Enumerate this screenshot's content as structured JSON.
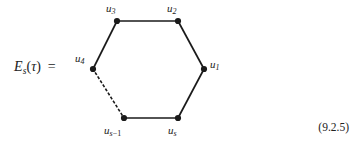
{
  "figure": {
    "kind": "graph-diagram",
    "background_color": "#ffffff",
    "ink_color": "#1a1a1a",
    "lhs": {
      "symbol": "E",
      "symbol_subscript": "s",
      "open_paren": "(",
      "argument": "τ",
      "close_paren": ")",
      "equals": "="
    },
    "vertices": [
      {
        "id": "u1",
        "base": "u",
        "sub": "1",
        "sub_op": "",
        "x": 204,
        "y": 69,
        "label_pos": "right"
      },
      {
        "id": "u2",
        "base": "u",
        "sub": "2",
        "sub_op": "",
        "x": 178,
        "y": 21,
        "label_pos": "above"
      },
      {
        "id": "u3",
        "base": "u",
        "sub": "3",
        "sub_op": "",
        "x": 117,
        "y": 21,
        "label_pos": "above"
      },
      {
        "id": "u4",
        "base": "u",
        "sub": "4",
        "sub_op": "",
        "x": 93,
        "y": 69,
        "label_pos": "left"
      },
      {
        "id": "us1",
        "base": "u",
        "sub": "s",
        "sub_op": "−1",
        "x": 124,
        "y": 118,
        "label_pos": "below"
      },
      {
        "id": "us",
        "base": "u",
        "sub": "s",
        "sub_op": "",
        "x": 178,
        "y": 118,
        "label_pos": "below"
      }
    ],
    "edges": [
      {
        "from": "u3",
        "to": "u2",
        "style": "solid"
      },
      {
        "from": "u2",
        "to": "u1",
        "style": "solid"
      },
      {
        "from": "u1",
        "to": "us",
        "style": "solid"
      },
      {
        "from": "us",
        "to": "us1",
        "style": "solid"
      },
      {
        "from": "u4",
        "to": "u3",
        "style": "solid"
      },
      {
        "from": "u4",
        "to": "us1",
        "style": "dotted"
      }
    ],
    "equation_number": "(9.2.5)"
  }
}
